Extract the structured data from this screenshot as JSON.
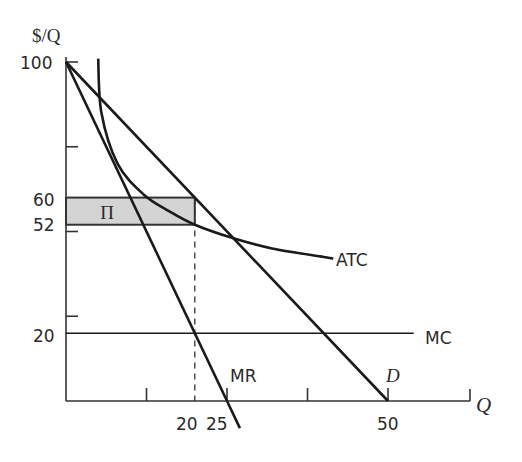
{
  "chart_data": {
    "type": "line",
    "title": "",
    "xlabel": "Q",
    "ylabel": "$/Q",
    "xlim": [
      0,
      62
    ],
    "ylim": [
      0,
      100
    ],
    "grid": false,
    "legend": "none (curves labeled inline)",
    "y_tick_labels": [
      {
        "value": 100,
        "label": "100"
      },
      {
        "value": 60,
        "label": "60"
      },
      {
        "value": 52,
        "label": "52"
      },
      {
        "value": 20,
        "label": "20"
      }
    ],
    "y_unlabeled_ticks": [
      75,
      50,
      25
    ],
    "x_tick_labels": [
      {
        "value": 20,
        "label": "20"
      },
      {
        "value": 25,
        "label": "25"
      },
      {
        "value": 50,
        "label": "50"
      }
    ],
    "x_unlabeled_ticks": [
      12.5,
      37.5
    ],
    "series": [
      {
        "name": "D",
        "label": "D",
        "kind": "linear demand",
        "points": [
          [
            0,
            100
          ],
          [
            50,
            0
          ]
        ]
      },
      {
        "name": "MR",
        "label": "MR",
        "kind": "marginal revenue",
        "points": [
          [
            0,
            100
          ],
          [
            25,
            0
          ],
          [
            27,
            -8
          ]
        ]
      },
      {
        "name": "MC",
        "label": "MC",
        "kind": "constant marginal cost",
        "points": [
          [
            0,
            20
          ],
          [
            54,
            20
          ]
        ]
      },
      {
        "name": "ATC",
        "label": "ATC",
        "kind": "average total cost",
        "points": [
          [
            5,
            101
          ],
          [
            5.5,
            85
          ],
          [
            8,
            70
          ],
          [
            12,
            61
          ],
          [
            16,
            56
          ],
          [
            20,
            52
          ],
          [
            26,
            48
          ],
          [
            32,
            45
          ],
          [
            40,
            42.5
          ],
          [
            41.5,
            42
          ]
        ]
      }
    ],
    "annotations": [
      {
        "type": "shaded_rect",
        "label": "Π",
        "meaning": "profit",
        "x": [
          0,
          20
        ],
        "y": [
          52,
          60
        ],
        "fill": "#d4d4d4"
      },
      {
        "type": "dashed_vline",
        "x": 20,
        "y": [
          0,
          60
        ]
      }
    ],
    "optimum": {
      "Q": 20,
      "P": 60,
      "ATC": 52,
      "MC": 20,
      "profit_per_unit": 8
    }
  },
  "labels": {
    "y_axis": "$/Q",
    "x_axis": "Q",
    "profit": "Π",
    "atc": "ATC",
    "mc": "MC",
    "mr": "MR",
    "d": "D",
    "y100": "100",
    "y60": "60",
    "y52": "52",
    "y20": "20",
    "x20": "20",
    "x25": "25",
    "x50": "50"
  },
  "colors": {
    "line": "#1a1a1a",
    "axis": "#333333",
    "shade": "#d4d4d4",
    "text": "#2a2a2a"
  }
}
